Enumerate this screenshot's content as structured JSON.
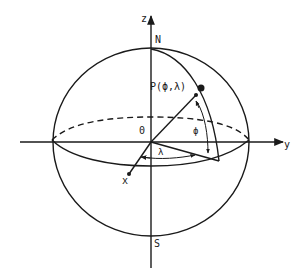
{
  "diagram": {
    "type": "spherical coordinate system (latitude/longitude on sphere)",
    "labels": {
      "z_axis": "z",
      "y_axis": "y",
      "x_axis": "x",
      "north": "N",
      "south": "S",
      "origin": "0",
      "point": "P(ϕ,λ)",
      "latitude": "ϕ",
      "longitude": "λ"
    },
    "colors": {
      "stroke": "#1a1a1a",
      "background": "#ffffff"
    }
  }
}
